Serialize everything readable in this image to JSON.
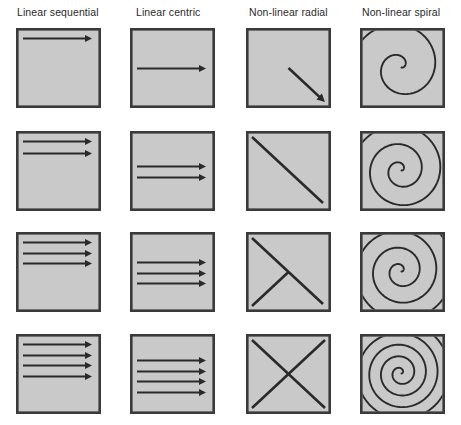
{
  "figure": {
    "title": "",
    "background_color": "#ffffff",
    "panel_fill": "#c9c9c9",
    "panel_stroke": "#3a3a3a",
    "ink_color": "#2a2a2a",
    "columns": [
      {
        "key": "linear_sequential",
        "label": "Linear sequential"
      },
      {
        "key": "linear_centric",
        "label": "Linear centric"
      },
      {
        "key": "nonlinear_radial",
        "label": "Non-linear radial"
      },
      {
        "key": "nonlinear_spiral",
        "label": "Non-linear spiral"
      }
    ],
    "rows": [
      {
        "key": "stage-1",
        "label": ""
      },
      {
        "key": "stage-2",
        "label": ""
      },
      {
        "key": "stage-3",
        "label": ""
      },
      {
        "key": "stage-4",
        "label": ""
      }
    ],
    "grid": {
      "columns": 4,
      "rows": 4,
      "panel_width": 85,
      "panel_height": 80,
      "column_x": [
        16,
        130,
        246,
        360
      ],
      "row_y": [
        28,
        131,
        232,
        334
      ]
    }
  },
  "chart_data": {
    "type": "diagram-grid",
    "xlabel": "",
    "ylabel": "",
    "categories": [
      "Linear sequential",
      "Linear centric",
      "Non-linear radial",
      "Non-linear spiral"
    ],
    "row_labels": [
      "stage-1",
      "stage-2",
      "stage-3",
      "stage-4"
    ],
    "series": [
      {
        "name": "Linear sequential",
        "values": [
          1,
          2,
          3,
          4
        ],
        "unit": "arrows"
      },
      {
        "name": "Linear centric",
        "values": [
          1,
          2,
          3,
          4
        ],
        "unit": "arrows"
      },
      {
        "name": "Non-linear radial",
        "values": [
          1,
          2,
          3,
          4
        ],
        "unit": "diagonal strokes"
      },
      {
        "name": "Non-linear spiral",
        "values": [
          1.5,
          2.5,
          3.5,
          5
        ],
        "unit": "spiral turns"
      }
    ],
    "panels": [
      {
        "column": "Linear sequential",
        "row": "stage-1",
        "description": "One horizontal arrow near the top of the panel pointing right.",
        "arrow_count": 1,
        "arrow_y_fractions": [
          0.13
        ]
      },
      {
        "column": "Linear sequential",
        "row": "stage-2",
        "description": "Two horizontal arrows stacked near the top pointing right.",
        "arrow_count": 2,
        "arrow_y_fractions": [
          0.13,
          0.27
        ]
      },
      {
        "column": "Linear sequential",
        "row": "stage-3",
        "description": "Three horizontal arrows stacked near the top pointing right.",
        "arrow_count": 3,
        "arrow_y_fractions": [
          0.13,
          0.26,
          0.39
        ]
      },
      {
        "column": "Linear sequential",
        "row": "stage-4",
        "description": "Four horizontal arrows stacked near the top pointing right.",
        "arrow_count": 4,
        "arrow_y_fractions": [
          0.13,
          0.26,
          0.39,
          0.52
        ]
      },
      {
        "column": "Linear centric",
        "row": "stage-1",
        "description": "One horizontal arrow across the vertical middle pointing right.",
        "arrow_count": 1,
        "arrow_y_fractions": [
          0.5
        ]
      },
      {
        "column": "Linear centric",
        "row": "stage-2",
        "description": "Two horizontal arrows centred vertically pointing right.",
        "arrow_count": 2,
        "arrow_y_fractions": [
          0.44,
          0.58
        ]
      },
      {
        "column": "Linear centric",
        "row": "stage-3",
        "description": "Three horizontal arrows centred vertically pointing right.",
        "arrow_count": 3,
        "arrow_y_fractions": [
          0.38,
          0.51,
          0.64
        ]
      },
      {
        "column": "Linear centric",
        "row": "stage-4",
        "description": "Four horizontal arrows centred vertically pointing right.",
        "arrow_count": 4,
        "arrow_y_fractions": [
          0.33,
          0.46,
          0.59,
          0.72
        ]
      },
      {
        "column": "Non-linear radial",
        "row": "stage-1",
        "description": "A single diagonal arrow from the panel centre to the bottom-right corner.",
        "stroke_count": 1
      },
      {
        "column": "Non-linear radial",
        "row": "stage-2",
        "description": "A full diagonal from the top-left corner to the bottom-right corner.",
        "stroke_count": 2
      },
      {
        "column": "Non-linear radial",
        "row": "stage-3",
        "description": "Full top-left to bottom-right diagonal plus a stroke from the bottom-left corner to the centre.",
        "stroke_count": 3
      },
      {
        "column": "Non-linear radial",
        "row": "stage-4",
        "description": "Complete X: both diagonals corner to corner.",
        "stroke_count": 4
      },
      {
        "column": "Non-linear spiral",
        "row": "stage-1",
        "description": "Loose counter-clockwise spiral of roughly one and a half turns.",
        "turns": 1.5
      },
      {
        "column": "Non-linear spiral",
        "row": "stage-2",
        "description": "Counter-clockwise spiral of roughly two and a half turns.",
        "turns": 2.5
      },
      {
        "column": "Non-linear spiral",
        "row": "stage-3",
        "description": "Counter-clockwise spiral of roughly three and a half turns.",
        "turns": 3.5
      },
      {
        "column": "Non-linear spiral",
        "row": "stage-4",
        "description": "Dense counter-clockwise spiral of roughly five turns filling the panel.",
        "turns": 5
      }
    ],
    "legend": [],
    "grid_on": false
  }
}
